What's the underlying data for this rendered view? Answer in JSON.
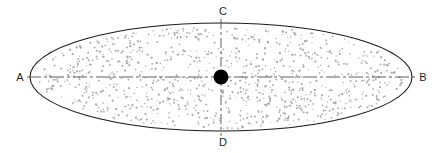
{
  "figure": {
    "type": "ellipse-axes-diagram",
    "title": "",
    "background_color": "#ffffff",
    "outline_color": "#1a1a1a",
    "axis_line_color": "#4d4d4d",
    "stipple_color": "#a8a8a8",
    "center_dot_color": "#000000",
    "canvas": {
      "width": 438,
      "height": 153
    }
  },
  "ellipse": {
    "center_x": 221,
    "center_y": 77,
    "radius_x": 191,
    "radius_y": 54,
    "stroke_width": 1.1,
    "fill": "stipple"
  },
  "center_point": {
    "label": "",
    "x": 221,
    "y": 77,
    "radius": 7.5
  },
  "labels": [
    {
      "id": "A",
      "text": "A",
      "x": 20,
      "y": 81,
      "anchor": "middle",
      "position": "left-end-of-major-axis"
    },
    {
      "id": "B",
      "text": "B",
      "x": 423,
      "y": 81,
      "anchor": "middle",
      "position": "right-end-of-major-axis"
    },
    {
      "id": "C",
      "text": "C",
      "x": 223,
      "y": 15,
      "anchor": "middle",
      "position": "top-end-of-minor-axis"
    },
    {
      "id": "D",
      "text": "D",
      "x": 223,
      "y": 146,
      "anchor": "middle",
      "position": "bottom-end-of-minor-axis"
    }
  ],
  "axes": [
    {
      "id": "major-axis",
      "from_label": "A",
      "to_label": "B",
      "orientation": "horizontal",
      "x1": 27,
      "y1": 77,
      "x2": 416,
      "y2": 77,
      "style": "dash-dot",
      "dash_array": "14,3,3,3",
      "stroke_width": 0.9
    },
    {
      "id": "minor-axis",
      "from_label": "C",
      "to_label": "D",
      "orientation": "vertical",
      "x1": 221,
      "y1": 19,
      "x2": 221,
      "y2": 136,
      "style": "dash-dot",
      "dash_array": "10,3,3,3",
      "stroke_width": 0.9
    }
  ],
  "stipple": {
    "seed": 20240531,
    "count": 980,
    "dot_radius_min": 0.55,
    "dot_radius_max": 1.15,
    "inset": 0.955,
    "color": "#a8a8a8"
  }
}
